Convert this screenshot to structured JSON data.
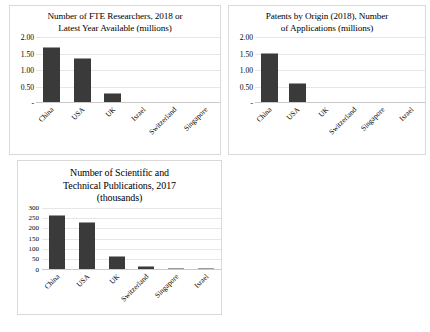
{
  "chart_data": [
    {
      "id": "researchers",
      "type": "bar",
      "title": "Number of FTE Researchers, 2018 or Latest Year Available (millions)",
      "title_lines": [
        "Number of FTE Researchers, 2018 or",
        "Latest Year Available (millions)"
      ],
      "categories": [
        "China",
        "USA",
        "UK",
        "Israel",
        "Switzerland",
        "Singapore"
      ],
      "values": [
        1.7,
        1.37,
        0.31,
        0.03,
        0.02,
        0.02
      ],
      "ytick_labels": [
        "2.00",
        "1.50",
        "1.00",
        "0.50",
        "-"
      ],
      "ytick_values": [
        2.0,
        1.5,
        1.0,
        0.5,
        0.0
      ],
      "ylim": [
        0,
        2.0
      ],
      "xlabel": "",
      "ylabel": "",
      "grid": true,
      "legend": "none"
    },
    {
      "id": "patents",
      "type": "bar",
      "title": "Patents by Origin (2018), Number of Applications (millions)",
      "title_lines": [
        "Patents by Origin (2018), Number",
        "of Applications (millions)"
      ],
      "categories": [
        "China",
        "USA",
        "UK",
        "Switzerland",
        "Singapore",
        "Israel"
      ],
      "values": [
        1.52,
        0.6,
        0.02,
        0.005,
        0.005,
        0.005
      ],
      "ytick_labels": [
        "2.00",
        "1.50",
        "1.00",
        "0.50",
        "-"
      ],
      "ytick_values": [
        2.0,
        1.5,
        1.0,
        0.5,
        0.0
      ],
      "ylim": [
        0,
        2.0
      ],
      "xlabel": "",
      "ylabel": "",
      "grid": true,
      "legend": "none"
    },
    {
      "id": "publications",
      "type": "bar",
      "title": "Number of Scientific and Technical Publications, 2017 (thousands)",
      "title_lines": [
        "Number of Scientific and",
        "Technical Publications, 2017",
        "(thousands)"
      ],
      "categories": [
        "China",
        "USA",
        "UK",
        "Switzerland",
        "Singapore",
        "Israel"
      ],
      "values": [
        265,
        230,
        68,
        17,
        11,
        10
      ],
      "ytick_labels": [
        "300",
        "250",
        "200",
        "150",
        "100",
        "50",
        "0"
      ],
      "ytick_values": [
        300,
        250,
        200,
        150,
        100,
        50,
        0
      ],
      "ylim": [
        0,
        300
      ],
      "xlabel": "",
      "ylabel": "",
      "grid": true,
      "legend": "none"
    }
  ],
  "style": {
    "bar_color": "#3a3a3a",
    "bar_top_color": "#9a9a9a",
    "gridline_color": "#e6e6e6",
    "panel_border_color": "#d9d9d9",
    "background": "#ffffff",
    "text_color": "#000000"
  }
}
